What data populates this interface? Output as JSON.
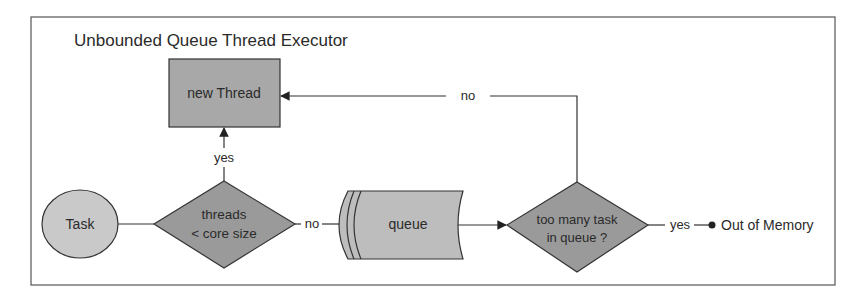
{
  "title": "Unbounded Queue Thread Executor",
  "nodes": {
    "task": {
      "label": "Task",
      "shape": "ellipse",
      "fill": "#c9c9c9"
    },
    "decision_core": {
      "label_line1": "threads",
      "label_line2": "< core size",
      "shape": "diamond",
      "fill": "#9a9a9a"
    },
    "new_thread": {
      "label": "new Thread",
      "shape": "rectangle",
      "fill": "#a8a8a8"
    },
    "queue": {
      "label": "queue",
      "shape": "stored-data",
      "fill": "#bdbdbd"
    },
    "decision_queue": {
      "label_line1": "too many task",
      "label_line2": "in queue ?",
      "shape": "diamond",
      "fill": "#9a9a9a"
    },
    "out_of_memory": {
      "label": "Out of Memory",
      "shape": "terminal-dot"
    }
  },
  "edges": {
    "yes_to_new_thread": "yes",
    "no_to_queue": "no",
    "no_back_to_new_thread": "no",
    "yes_to_oom": "yes"
  },
  "colors": {
    "stroke": "#333333",
    "frame": "#555555",
    "text": "#2a2a2a"
  }
}
